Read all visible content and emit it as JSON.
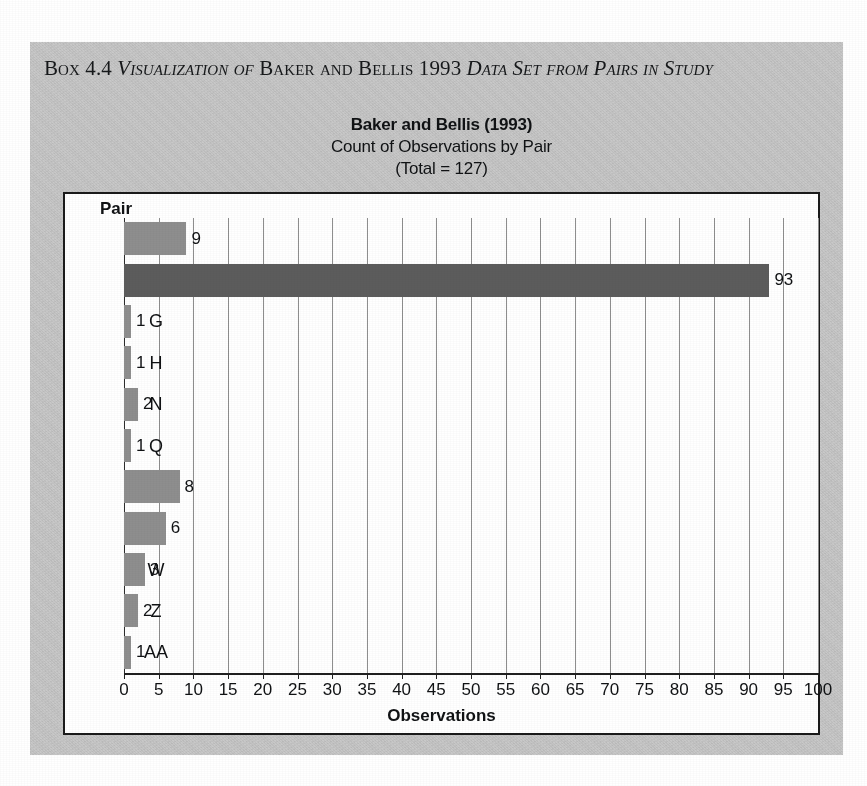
{
  "box": {
    "heading_parts": [
      {
        "text": "Box",
        "style": "smallcaps"
      },
      {
        "text": " 4.4 ",
        "style": "normal"
      },
      {
        "text": "Visualization of",
        "style": "italic-smallcaps"
      },
      {
        "text": " ",
        "style": "normal"
      },
      {
        "text": "Baker and Bellis",
        "style": "smallcaps"
      },
      {
        "text": " 1993 ",
        "style": "normal"
      },
      {
        "text": "Data Set from Pairs in Study",
        "style": "italic-smallcaps"
      }
    ],
    "heading_plain": "Box 4.4 Visualization of Baker and Bellis 1993 Data Set from Pairs in Study",
    "background_color": "#c9c9c9"
  },
  "chart_data": {
    "type": "bar",
    "orientation": "horizontal",
    "title": "Baker and Bellis (1993)",
    "subtitle": "Count of Observations by Pair",
    "subtitle2": "(Total = 127)",
    "total": 127,
    "categories": [
      "A",
      "B",
      "G",
      "H",
      "N",
      "Q",
      "R",
      "S",
      "W",
      "Z",
      "AA"
    ],
    "values": [
      9,
      93,
      1,
      1,
      2,
      1,
      8,
      6,
      3,
      2,
      1
    ],
    "value_labels": [
      "9",
      "93",
      "1",
      "1",
      "2",
      "1",
      "8",
      "6",
      "3",
      "2",
      "1"
    ],
    "highlight_category": "B",
    "xlabel": "Observations",
    "ylabel": "Pair",
    "ylabel_header": "Pair",
    "xlim": [
      0,
      100
    ],
    "xticks": [
      0,
      5,
      10,
      15,
      20,
      25,
      30,
      35,
      40,
      45,
      50,
      55,
      60,
      65,
      70,
      75,
      80,
      85,
      90,
      95,
      100
    ],
    "xtick_labels": [
      "0",
      "5",
      "10",
      "15",
      "20",
      "25",
      "30",
      "35",
      "40",
      "45",
      "50",
      "55",
      "60",
      "65",
      "70",
      "75",
      "80",
      "85",
      "90",
      "95",
      "100"
    ],
    "grid": "vertical",
    "legend": "none",
    "bar_color": "#8e8e8e",
    "highlight_bar_color": "#5c5c5c",
    "plot_background": "#ffffff",
    "frame_color": "#1a1a1a"
  }
}
